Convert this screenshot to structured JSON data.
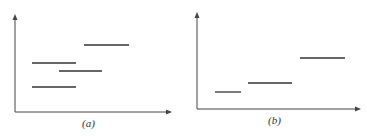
{
  "panels": [
    {
      "label": "(a)",
      "axes": {
        "origin": [
          15,
          112
        ],
        "y_top": 14,
        "x_right": 172
      },
      "segments": [
        {
          "x1": 84,
          "x2": 129,
          "y": 45
        },
        {
          "x1": 32,
          "x2": 76,
          "y": 63
        },
        {
          "x1": 59,
          "x2": 102,
          "y": 71
        },
        {
          "x1": 32,
          "x2": 76,
          "y": 87
        }
      ],
      "label_pos": [
        82,
        117
      ]
    },
    {
      "label": "(b)",
      "axes": {
        "origin": [
          197,
          109
        ],
        "y_top": 12,
        "x_right": 361
      },
      "segments": [
        {
          "x1": 215,
          "x2": 241,
          "y": 92
        },
        {
          "x1": 248,
          "x2": 292,
          "y": 83
        },
        {
          "x1": 300,
          "x2": 345,
          "y": 58
        }
      ],
      "label_pos": [
        268,
        114
      ]
    }
  ],
  "colors": {
    "line": "#333333",
    "axis": "#444444"
  }
}
